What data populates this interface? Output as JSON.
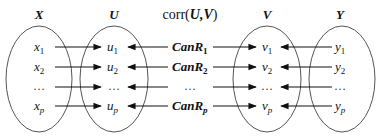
{
  "diagram": {
    "title": "corr(U,V)",
    "title_prefix": "corr(",
    "title_vars": "U,V",
    "title_suffix": ")",
    "colors": {
      "stroke": "#555555",
      "arrow": "#111111",
      "text": "#111111",
      "background": "#ffffff"
    },
    "groups": [
      {
        "id": "X",
        "label": "X",
        "items": [
          {
            "base": "x",
            "sub": "1"
          },
          {
            "base": "x",
            "sub": "2"
          },
          {
            "base": "…",
            "sub": ""
          },
          {
            "base": "x",
            "sub": "p"
          }
        ]
      },
      {
        "id": "U",
        "label": "U",
        "items": [
          {
            "base": "u",
            "sub": "1"
          },
          {
            "base": "u",
            "sub": "2"
          },
          {
            "base": "…",
            "sub": ""
          },
          {
            "base": "u",
            "sub": "p"
          }
        ]
      },
      {
        "id": "V",
        "label": "V",
        "items": [
          {
            "base": "v",
            "sub": "1"
          },
          {
            "base": "v",
            "sub": "2"
          },
          {
            "base": "…",
            "sub": ""
          },
          {
            "base": "v",
            "sub": "p"
          }
        ]
      },
      {
        "id": "Y",
        "label": "Y",
        "items": [
          {
            "base": "y",
            "sub": "1"
          },
          {
            "base": "y",
            "sub": "2"
          },
          {
            "base": "…",
            "sub": ""
          },
          {
            "base": "y",
            "sub": "p"
          }
        ]
      }
    ],
    "canonical_correlations": [
      {
        "base": "CanR",
        "sub": "1"
      },
      {
        "base": "CanR",
        "sub": "2"
      },
      {
        "base": "…",
        "sub": ""
      },
      {
        "base": "CanR",
        "sub": "p"
      }
    ],
    "edges": [
      {
        "from": "X",
        "to": "U",
        "direction": "right"
      },
      {
        "from": "CanR",
        "to": "U",
        "direction": "left"
      },
      {
        "from": "CanR",
        "to": "V",
        "direction": "right"
      },
      {
        "from": "Y",
        "to": "V",
        "direction": "left"
      }
    ]
  }
}
